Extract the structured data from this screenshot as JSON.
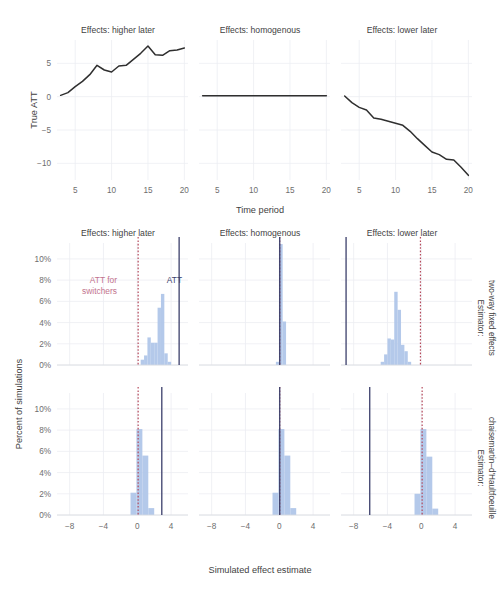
{
  "figure": {
    "panel_titles": [
      "Effects: higher later",
      "Effects: homogenous",
      "Effects: lower later"
    ],
    "row_strips": [
      "Estimator:\ntwo-way fixed effects",
      "Estimator:\nchaisemartin–d'Haultfoeuille"
    ],
    "row_strip_line1": [
      "Estimator:",
      "Estimator:"
    ],
    "row_strip_line2": [
      "two-way fixed effects",
      "chaisemartin–d'Haultfoeuille"
    ],
    "annotations": {
      "switchers_line1": "ATT for",
      "switchers_line2": "switchers",
      "att": "ATT"
    },
    "colors": {
      "bar_fill": "#aec4e8",
      "att_line": "#3b3f6b",
      "switchers_line": "#b5495b",
      "switchers_text": "#c2738d",
      "series_line": "#2f2f2f",
      "grid": "#eceef3",
      "background": "#ffffff"
    }
  },
  "chart_data": [
    {
      "type": "line",
      "id": "true-att-higher-later",
      "title": "Effects: higher later",
      "xlabel": "Time period",
      "ylabel": "True ATT",
      "xlim": [
        2.5,
        20.5
      ],
      "ylim": [
        -12.5,
        8.5
      ],
      "xticks": [
        5,
        10,
        15,
        20
      ],
      "yticks": [
        5,
        0,
        -5,
        -10
      ],
      "ytick_labels": [
        "5",
        "0",
        "−5",
        "−10"
      ],
      "grid": true,
      "x": [
        3,
        4,
        5,
        6,
        7,
        8,
        9,
        10,
        11,
        12,
        13,
        14,
        15,
        16,
        17,
        18,
        19,
        20
      ],
      "y": [
        0.2,
        0.6,
        1.5,
        2.3,
        3.3,
        4.7,
        4.0,
        3.7,
        4.6,
        4.7,
        5.6,
        6.5,
        7.6,
        6.3,
        6.2,
        6.9,
        7.0,
        7.3
      ]
    },
    {
      "type": "line",
      "id": "true-att-homogenous",
      "title": "Effects: homogenous",
      "xlabel": "Time period",
      "ylabel": "True ATT",
      "xlim": [
        2.5,
        20.5
      ],
      "ylim": [
        -12.5,
        8.5
      ],
      "xticks": [
        5,
        10,
        15,
        20
      ],
      "yticks": [
        5,
        0,
        -5,
        -10
      ],
      "grid": true,
      "x": [
        3,
        4,
        5,
        6,
        7,
        8,
        9,
        10,
        11,
        12,
        13,
        14,
        15,
        16,
        17,
        18,
        19,
        20
      ],
      "y": [
        0.15,
        0.15,
        0.15,
        0.15,
        0.15,
        0.15,
        0.15,
        0.15,
        0.15,
        0.15,
        0.15,
        0.15,
        0.15,
        0.15,
        0.15,
        0.15,
        0.15,
        0.15
      ]
    },
    {
      "type": "line",
      "id": "true-att-lower-later",
      "title": "Effects: lower later",
      "xlabel": "Time period",
      "ylabel": "True ATT",
      "xlim": [
        2.5,
        20.5
      ],
      "ylim": [
        -12.5,
        8.5
      ],
      "xticks": [
        5,
        10,
        15,
        20
      ],
      "yticks": [
        5,
        0,
        -5,
        -10
      ],
      "grid": true,
      "x": [
        3,
        4,
        5,
        6,
        7,
        8,
        9,
        10,
        11,
        12,
        13,
        14,
        15,
        16,
        17,
        18,
        19,
        20
      ],
      "y": [
        0.1,
        -0.9,
        -1.6,
        -2.0,
        -3.2,
        -3.4,
        -3.7,
        -4.0,
        -4.3,
        -5.2,
        -6.3,
        -7.3,
        -8.3,
        -8.7,
        -9.4,
        -9.5,
        -10.6,
        -11.8
      ]
    },
    {
      "type": "bar",
      "id": "hist-twfe-higher-later",
      "estimator": "Estimator: two-way fixed effects",
      "facet": "Effects: higher later",
      "xlabel": "Simulated effect estimate",
      "ylabel": "Percent of simulations",
      "xlim": [
        -9.5,
        6.0
      ],
      "ylim": [
        0,
        11.5
      ],
      "xticks": [
        -8,
        -4,
        0,
        4
      ],
      "xtick_labels": [
        "−8",
        "−4",
        "0",
        "4"
      ],
      "yticks": [
        0,
        2,
        4,
        6,
        8,
        10
      ],
      "ytick_labels": [
        "0%",
        "2%",
        "4%",
        "6%",
        "8%",
        "10%"
      ],
      "bin_width": 0.4,
      "bin_centers": [
        0.6,
        1.0,
        1.4,
        1.8,
        2.2,
        2.6,
        3.0,
        3.4,
        3.8
      ],
      "values": [
        0.5,
        0.9,
        2.6,
        2.1,
        2.1,
        5.4,
        6.7,
        1.1,
        0.3
      ],
      "reference_lines": {
        "att": 4.95,
        "att_for_switchers": 0.1
      }
    },
    {
      "type": "bar",
      "id": "hist-twfe-homogenous",
      "estimator": "Estimator: two-way fixed effects",
      "facet": "Effects: homogenous",
      "xlabel": "Simulated effect estimate",
      "ylabel": "Percent of simulations",
      "xlim": [
        -9.5,
        6.0
      ],
      "ylim": [
        0,
        11.5
      ],
      "xticks": [
        -8,
        -4,
        0,
        4
      ],
      "yticks": [
        0,
        2,
        4,
        6,
        8,
        10
      ],
      "bin_width": 0.4,
      "bin_centers": [
        -0.2,
        0.2,
        0.6
      ],
      "values": [
        0.3,
        11.4,
        4.1
      ],
      "reference_lines": {
        "att": 0.05,
        "att_for_switchers": 0.05
      }
    },
    {
      "type": "bar",
      "id": "hist-twfe-lower-later",
      "estimator": "Estimator: two-way fixed effects",
      "facet": "Effects: lower later",
      "xlabel": "Simulated effect estimate",
      "ylabel": "Percent of simulations",
      "xlim": [
        -9.5,
        6.0
      ],
      "ylim": [
        0,
        11.5
      ],
      "xticks": [
        -8,
        -4,
        0,
        4
      ],
      "yticks": [
        0,
        2,
        4,
        6,
        8,
        10
      ],
      "bin_width": 0.4,
      "bin_centers": [
        -4.6,
        -4.2,
        -3.8,
        -3.4,
        -3.0,
        -2.6,
        -2.2,
        -1.8,
        -1.4
      ],
      "values": [
        0.3,
        1.0,
        2.5,
        2.4,
        6.9,
        5.2,
        1.9,
        1.3,
        0.3
      ],
      "reference_lines": {
        "att": -8.9,
        "att_for_switchers": -0.1
      }
    },
    {
      "type": "bar",
      "id": "hist-cdh-higher-later",
      "estimator": "Estimator: chaisemartin–d'Haultfoeuille",
      "facet": "Effects: higher later",
      "xlabel": "Simulated effect estimate",
      "ylabel": "Percent of simulations",
      "xlim": [
        -9.5,
        6.0
      ],
      "ylim": [
        0,
        11.5
      ],
      "xticks": [
        -8,
        -4,
        0,
        4
      ],
      "yticks": [
        0,
        2,
        4,
        6,
        8,
        10
      ],
      "bin_width": 0.7,
      "bin_centers": [
        -0.45,
        0.25,
        0.95
      ],
      "values": [
        2.1,
        8.1,
        5.6
      ],
      "extra_bin_centers": [
        1.65
      ],
      "extra_values": [
        0.65
      ],
      "reference_lines": {
        "att": 2.9,
        "att_for_switchers": 0.1
      }
    },
    {
      "type": "bar",
      "id": "hist-cdh-homogenous",
      "estimator": "Estimator: chaisemartin–d'Haultfoeuille",
      "facet": "Effects: homogenous",
      "xlabel": "Simulated effect estimate",
      "ylabel": "Percent of simulations",
      "xlim": [
        -9.5,
        6.0
      ],
      "ylim": [
        0,
        11.5
      ],
      "xticks": [
        -8,
        -4,
        0,
        4
      ],
      "yticks": [
        0,
        2,
        4,
        6,
        8,
        10
      ],
      "bin_width": 0.7,
      "bin_centers": [
        -0.45,
        0.25,
        0.95
      ],
      "values": [
        2.1,
        8.1,
        5.6
      ],
      "extra_bin_centers": [
        1.65
      ],
      "extra_values": [
        0.65
      ],
      "reference_lines": {
        "att": 0.05,
        "att_for_switchers": 0.05
      }
    },
    {
      "type": "bar",
      "id": "hist-cdh-lower-later",
      "estimator": "Estimator: chaisemartin–d'Haultfoeuille",
      "facet": "Effects: lower later",
      "xlabel": "Simulated effect estimate",
      "ylabel": "Percent of simulations",
      "xlim": [
        -9.5,
        6.0
      ],
      "ylim": [
        0,
        11.5
      ],
      "xticks": [
        -8,
        -4,
        0,
        4
      ],
      "yticks": [
        0,
        2,
        4,
        6,
        8,
        10
      ],
      "bin_width": 0.7,
      "bin_centers": [
        -0.45,
        0.25,
        0.95
      ],
      "values": [
        2.0,
        8.1,
        5.5
      ],
      "extra_bin_centers": [
        1.65
      ],
      "extra_values": [
        0.6
      ],
      "reference_lines": {
        "att": -6.1,
        "att_for_switchers": 0.1
      }
    }
  ],
  "axes": {
    "top_ylabel": "True ATT",
    "top_xlabel": "Time period",
    "bottom_ylabel": "Percent of simulations",
    "bottom_xlabel": "Simulated effect estimate",
    "top_yticks": [
      "5",
      "0",
      "−5",
      "−10"
    ],
    "top_xticks": [
      "5",
      "10",
      "15",
      "20"
    ],
    "hist_yticks": [
      "10%",
      "8%",
      "6%",
      "4%",
      "2%",
      "0%"
    ],
    "hist_xticks": [
      "−8",
      "−4",
      "0",
      "4"
    ]
  }
}
